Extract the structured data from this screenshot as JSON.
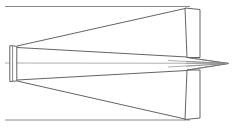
{
  "figure": {
    "title": "Optical ray trace diagram",
    "background_color": "#ffffff",
    "line_color": "#3c3c3c",
    "line_color_secondary": "#646464",
    "line_color_faint": "#8c8c8c",
    "canvas": {
      "width": 232,
      "height": 131
    }
  },
  "chart_data": {
    "type": "line",
    "title": "Optical ray trace diagram",
    "xlabel": "",
    "ylabel": "",
    "xlim": [
      0,
      232
    ],
    "ylim": [
      0,
      131
    ],
    "grid": false,
    "legend": null,
    "axis_of_symmetry_y": 63.5,
    "elements": [
      {
        "name": "left-aperture",
        "type": "rect",
        "x": 9.5,
        "y": 45.0,
        "width": 7.5,
        "height": 37.5,
        "tilt_deg": 1.5
      },
      {
        "name": "upper-panel",
        "type": "rect",
        "corners": [
          [
            185.0,
            8.0
          ],
          [
            200.0,
            9.5
          ],
          [
            200.0,
            57.5
          ],
          [
            187.0,
            57.5
          ]
        ],
        "tilt_deg": 2.0
      },
      {
        "name": "lower-panel",
        "type": "rect",
        "corners": [
          [
            187.0,
            70.0
          ],
          [
            200.0,
            70.0
          ],
          [
            200.0,
            118.0
          ],
          [
            185.0,
            119.5
          ]
        ],
        "tilt_deg": 2.0
      }
    ],
    "series": [
      {
        "name": "upper-boundary-line",
        "points": [
          [
            5.0,
            6.5
          ],
          [
            190.0,
            6.5
          ]
        ]
      },
      {
        "name": "lower-boundary-line",
        "points": [
          [
            5.0,
            120.0
          ],
          [
            190.0,
            120.0
          ]
        ]
      },
      {
        "name": "optical-axis",
        "points": [
          [
            5.0,
            63.0
          ],
          [
            228.5,
            63.0
          ]
        ]
      },
      {
        "name": "upper-ray-steep",
        "points": [
          [
            17.0,
            46.0
          ],
          [
            185.0,
            8.5
          ]
        ]
      },
      {
        "name": "upper-ray-shallow",
        "points": [
          [
            17.0,
            47.5
          ],
          [
            187.0,
            57.0
          ]
        ]
      },
      {
        "name": "lower-ray-steep",
        "points": [
          [
            17.0,
            81.0
          ],
          [
            185.0,
            119.0
          ]
        ]
      },
      {
        "name": "lower-ray-shallow",
        "points": [
          [
            17.0,
            80.0
          ],
          [
            187.0,
            70.5
          ]
        ]
      },
      {
        "name": "upper-converging-ray",
        "points": [
          [
            187.0,
            57.5
          ],
          [
            228.5,
            63.5
          ]
        ]
      },
      {
        "name": "lower-converging-ray",
        "points": [
          [
            187.0,
            70.0
          ],
          [
            228.5,
            63.5
          ]
        ]
      },
      {
        "name": "focus-spike-upper",
        "points": [
          [
            168.0,
            60.5
          ],
          [
            228.5,
            63.5
          ]
        ]
      },
      {
        "name": "focus-spike-lower",
        "points": [
          [
            168.0,
            67.0
          ],
          [
            228.5,
            63.5
          ]
        ]
      }
    ],
    "focal_point": {
      "x": 228.5,
      "y": 63.5
    }
  }
}
